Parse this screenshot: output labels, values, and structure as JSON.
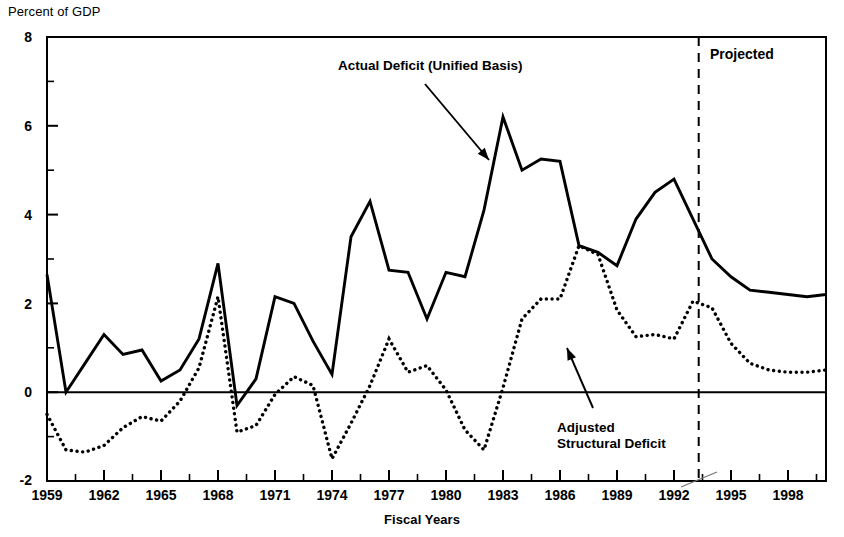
{
  "chart_data": {
    "type": "line",
    "title": "",
    "ylabel": "Percent of GDP",
    "xlabel": "Fiscal Years",
    "ylim": [
      -2,
      8
    ],
    "xlim": [
      1959,
      2000
    ],
    "grid": false,
    "y_ticks_major": [
      "-2",
      "0",
      "2",
      "4",
      "6",
      "8"
    ],
    "y_ticks_minor": [
      -1,
      1,
      3,
      5,
      7
    ],
    "x_tick_labels": [
      "1959",
      "1962",
      "1965",
      "1968",
      "1971",
      "1974",
      "1977",
      "1980",
      "1983",
      "1986",
      "1989",
      "1992",
      "1995",
      "1998"
    ],
    "x_tick_values": [
      1959,
      1962,
      1965,
      1968,
      1971,
      1974,
      1977,
      1980,
      1983,
      1986,
      1989,
      1992,
      1995,
      1998
    ],
    "x_minor_ticks": [
      1960.5,
      1963.5,
      1966.5,
      1969.5,
      1972.5,
      1975.5,
      1978.5,
      1981.5,
      1984.5,
      1987.5,
      1990.5,
      1993.5,
      1996.5,
      1999.5
    ],
    "legend_position": "inline-annotations",
    "series": [
      {
        "name": "Actual Deficit (Unified Basis)",
        "style": "solid",
        "color": "#000000",
        "x": [
          1959,
          1960,
          1961,
          1962,
          1963,
          1964,
          1965,
          1966,
          1967,
          1968,
          1969,
          1970,
          1971,
          1972,
          1973,
          1974,
          1975,
          1976,
          1977,
          1978,
          1979,
          1980,
          1981,
          1982,
          1983,
          1984,
          1985,
          1986,
          1987,
          1988,
          1989,
          1990,
          1991,
          1992,
          1993,
          1994,
          1995,
          1996,
          1997,
          1998,
          1999,
          2000
        ],
        "values": [
          2.65,
          0.0,
          0.65,
          1.3,
          0.85,
          0.95,
          0.25,
          0.5,
          1.2,
          2.9,
          -0.3,
          0.3,
          2.15,
          2.0,
          1.15,
          0.4,
          3.5,
          4.3,
          2.75,
          2.7,
          1.65,
          2.7,
          2.6,
          4.1,
          6.2,
          5.0,
          5.25,
          5.2,
          3.3,
          3.15,
          2.85,
          3.9,
          4.5,
          4.8,
          3.9,
          3.0,
          2.6,
          2.3,
          2.25,
          2.2,
          2.15,
          2.2
        ]
      },
      {
        "name": "Adjusted Structural Deficit",
        "style": "dotted",
        "color": "#000000",
        "x": [
          1959,
          1960,
          1961,
          1962,
          1963,
          1964,
          1965,
          1966,
          1967,
          1968,
          1969,
          1970,
          1971,
          1972,
          1973,
          1974,
          1975,
          1976,
          1977,
          1978,
          1979,
          1980,
          1981,
          1982,
          1983,
          1984,
          1985,
          1986,
          1987,
          1988,
          1989,
          1990,
          1991,
          1992,
          1993,
          1994,
          1995,
          1996,
          1997,
          1998,
          1999,
          2000
        ],
        "values": [
          -0.5,
          -1.3,
          -1.35,
          -1.2,
          -0.8,
          -0.55,
          -0.65,
          -0.2,
          0.55,
          2.15,
          -0.9,
          -0.75,
          -0.05,
          0.35,
          0.15,
          -1.5,
          -0.7,
          0.15,
          1.2,
          0.45,
          0.6,
          0.05,
          -0.85,
          -1.3,
          0.1,
          1.65,
          2.1,
          2.1,
          3.3,
          3.1,
          1.85,
          1.25,
          1.3,
          1.2,
          2.05,
          1.9,
          1.1,
          0.65,
          0.5,
          0.45,
          0.45,
          0.5
        ]
      }
    ],
    "annotations": [
      {
        "name": "actual-deficit-label",
        "text": "Actual Deficit (Unified Basis)",
        "arrow_to_year": 1981.5,
        "arrow_to_value": 3.6
      },
      {
        "name": "adjusted-structural-label",
        "line1": "Adjusted",
        "line2": "Structural Deficit",
        "arrow_to_year": 1988.3,
        "arrow_to_value": 1.3
      },
      {
        "name": "projected-label",
        "text": "Projected"
      }
    ],
    "divider": {
      "label": "Projected",
      "year": 1993.3,
      "style": "dashed"
    },
    "zero_line": true,
    "note": "Note: Content cut off at image bottom"
  },
  "chart": {
    "y_axis_title": "Percent of GDP",
    "x_axis_title": "Fiscal Years",
    "y_labels": [
      "8",
      "6",
      "4",
      "2",
      "0",
      "-2"
    ],
    "x_labels": [
      "1959",
      "1962",
      "1965",
      "1968",
      "1971",
      "1974",
      "1977",
      "1980",
      "1983",
      "1986",
      "1989",
      "1992",
      "1995",
      "1998"
    ],
    "annotation_actual": "Actual Deficit (Unified Basis)",
    "annotation_adjusted_line1": "Adjusted",
    "annotation_adjusted_line2": "Structural Deficit",
    "annotation_projected": "Projected"
  }
}
